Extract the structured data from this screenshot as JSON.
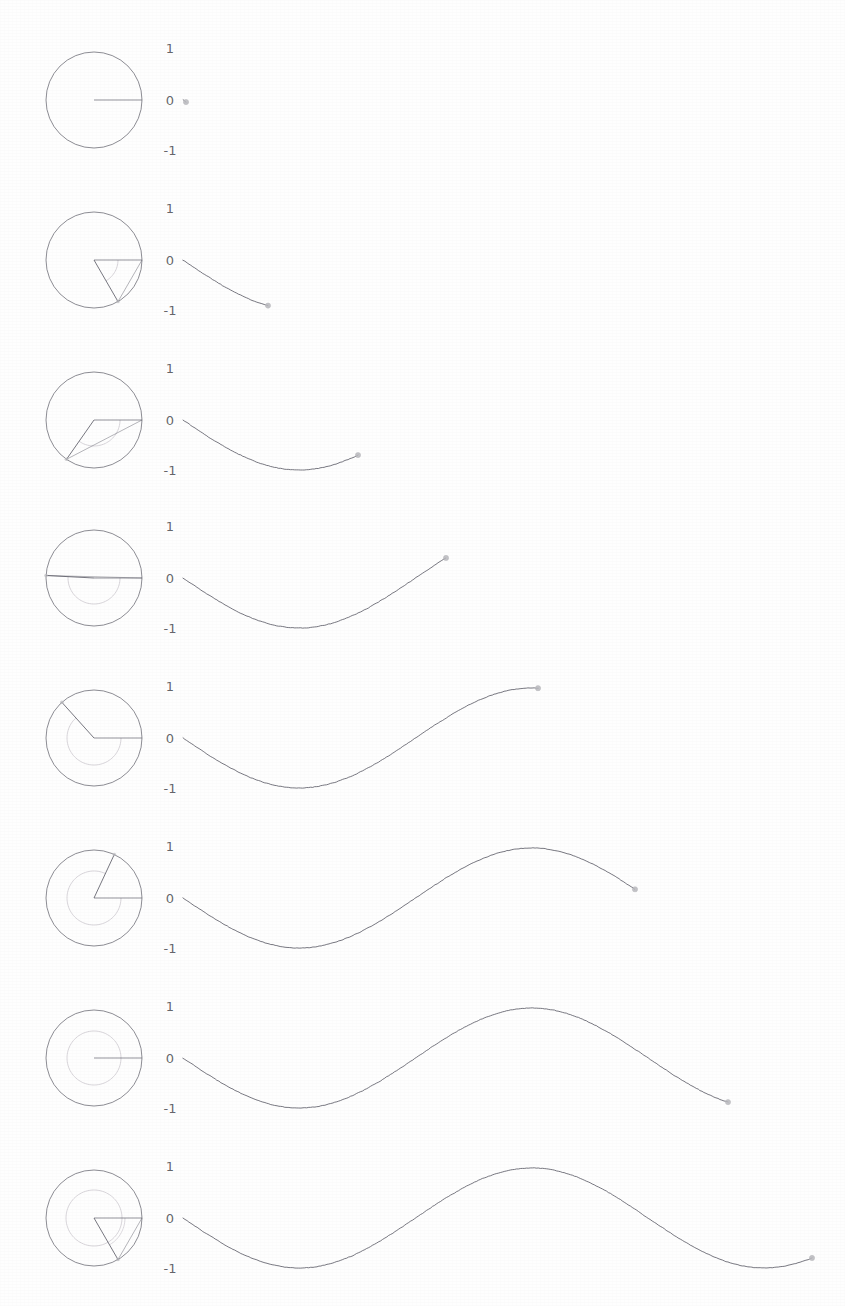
{
  "figure": {
    "title": "",
    "width": 845,
    "height": 1306,
    "background_color": "#ffffff",
    "stroke_color": "#555560",
    "arc_color": "#c9c4cc",
    "marker_color": "#b9b9bd",
    "label_color": "#4a4a50",
    "frame_count": 8
  },
  "axis": {
    "tick_labels": [
      "1",
      "0",
      "-1"
    ],
    "tick_values": [
      1,
      0,
      -1
    ],
    "label_x": 170,
    "top_label": "1",
    "zero_label": "0",
    "bottom_label": "-1"
  },
  "chart_data": {
    "type": "line",
    "subtitle": "",
    "xlabel": "",
    "ylabel": "",
    "ylim": [
      -1,
      1
    ],
    "grid": false,
    "legend": "none",
    "function": "y = -sin(x)",
    "tick_labels": [
      "1",
      "0",
      "-1"
    ],
    "frames": [
      {
        "index": 1,
        "angle_deg": 0,
        "angle_label": "0",
        "sine_value": 0,
        "circle": {
          "cx": 94,
          "cy": 100,
          "r": 48,
          "arc_r": 27
        },
        "radius_end": {
          "x": 142,
          "y": 100
        },
        "wave": {
          "x_start": 183,
          "x_end": 186,
          "y_baseline": 100,
          "amplitude": 50,
          "period_px": 465,
          "phase_px": 0
        },
        "marker": {
          "x": 186,
          "y": 100
        },
        "y_top": 48,
        "y_zero": 100,
        "y_bottom": 150,
        "row_top": 0,
        "values": [
          0
        ]
      },
      {
        "index": 2,
        "angle_deg": 60,
        "angle_label": "60",
        "sine_value": -0.87,
        "circle": {
          "cx": 94,
          "cy": 260,
          "r": 48,
          "arc_r": 24
        },
        "radius_end": {
          "x": 118,
          "y": 302
        },
        "wave": {
          "x_start": 183,
          "x_end": 268,
          "y_baseline": 260,
          "amplitude": 50,
          "period_px": 465,
          "phase_px": 0
        },
        "marker": {
          "x": 268,
          "y": 302
        },
        "y_top": 208,
        "y_zero": 260,
        "y_bottom": 310,
        "row_top": 160,
        "values": [
          0,
          -0.87
        ]
      },
      {
        "index": 3,
        "angle_deg": 125,
        "angle_label": "125",
        "sine_value": -0.82,
        "circle": {
          "cx": 94,
          "cy": 420,
          "r": 48,
          "arc_r": 26
        },
        "radius_end": {
          "x": 66,
          "y": 459
        },
        "wave": {
          "x_start": 183,
          "x_end": 358,
          "y_baseline": 420,
          "amplitude": 50,
          "period_px": 465,
          "phase_px": 0
        },
        "marker": {
          "x": 358,
          "y": 465
        },
        "y_top": 368,
        "y_zero": 420,
        "y_bottom": 470,
        "row_top": 320,
        "values": [
          0,
          -0.87,
          -0.82
        ]
      },
      {
        "index": 4,
        "angle_deg": 183,
        "angle_label": "183",
        "sine_value": -0.05,
        "circle": {
          "cx": 94,
          "cy": 578,
          "r": 48,
          "arc_r": 26
        },
        "radius_end": {
          "x": 46,
          "y": 581
        },
        "wave": {
          "x_start": 183,
          "x_end": 446,
          "y_baseline": 578,
          "amplitude": 50,
          "period_px": 465,
          "phase_px": 0
        },
        "marker": {
          "x": 446,
          "y": 581
        },
        "y_top": 526,
        "y_zero": 578,
        "y_bottom": 628,
        "row_top": 478,
        "values": [
          0,
          -0.87,
          -0.82,
          -0.05
        ]
      },
      {
        "index": 5,
        "angle_deg": 228,
        "angle_label": "228",
        "sine_value": 0.74,
        "circle": {
          "cx": 94,
          "cy": 738,
          "r": 48,
          "arc_r": 27
        },
        "radius_end": {
          "x": 62,
          "y": 702
        },
        "wave": {
          "x_start": 183,
          "x_end": 538,
          "y_baseline": 738,
          "amplitude": 50,
          "period_px": 465,
          "phase_px": 0
        },
        "marker": {
          "x": 538,
          "y": 700
        },
        "y_top": 686,
        "y_zero": 738,
        "y_bottom": 788,
        "row_top": 638,
        "values": [
          0,
          -0.87,
          -0.82,
          -0.05,
          0.74
        ]
      },
      {
        "index": 6,
        "angle_deg": 295,
        "angle_label": "295",
        "sine_value": 0.9,
        "circle": {
          "cx": 94,
          "cy": 898,
          "r": 48,
          "arc_r": 27
        },
        "radius_end": {
          "x": 114,
          "y": 854
        },
        "wave": {
          "x_start": 183,
          "x_end": 635,
          "y_baseline": 898,
          "amplitude": 50,
          "period_px": 465,
          "phase_px": 0
        },
        "marker": {
          "x": 635,
          "y": 855
        },
        "y_top": 846,
        "y_zero": 898,
        "y_bottom": 948,
        "row_top": 848,
        "values": [
          0,
          -0.87,
          -0.82,
          -0.05,
          0.74,
          0.9
        ]
      },
      {
        "index": 7,
        "angle_deg": 360,
        "angle_label": "360",
        "sine_value": 0,
        "circle": {
          "cx": 94,
          "cy": 1058,
          "r": 48,
          "arc_r": 27
        },
        "radius_end": {
          "x": 142,
          "y": 1058
        },
        "wave": {
          "x_start": 183,
          "x_end": 728,
          "y_baseline": 1058,
          "amplitude": 50,
          "period_px": 465,
          "phase_px": 0
        },
        "marker": {
          "x": 728,
          "y": 1058
        },
        "y_top": 1006,
        "y_zero": 1058,
        "y_bottom": 1108,
        "row_top": 1008,
        "values": [
          0,
          -0.87,
          -0.82,
          -0.05,
          0.74,
          0.9,
          0
        ]
      },
      {
        "index": 8,
        "angle_deg": 420,
        "angle_label": "420",
        "sine_value": -0.87,
        "circle": {
          "cx": 94,
          "cy": 1218,
          "r": 48,
          "arc_r": 28
        },
        "radius_end": {
          "x": 120,
          "y": 1260
        },
        "wave": {
          "x_start": 183,
          "x_end": 812,
          "y_baseline": 1218,
          "amplitude": 50,
          "period_px": 465,
          "phase_px": 0
        },
        "marker": {
          "x": 812,
          "y": 1259
        },
        "y_top": 1166,
        "y_zero": 1218,
        "y_bottom": 1268,
        "row_top": 1168,
        "values": [
          0,
          -0.87,
          -0.82,
          -0.05,
          0.74,
          0.9,
          0,
          -0.87
        ]
      }
    ]
  }
}
